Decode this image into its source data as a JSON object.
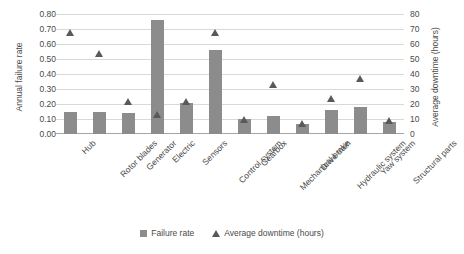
{
  "chart_data": {
    "type": "bar",
    "title": "",
    "xlabel": "",
    "ylabel": "Annual failure rate",
    "y2label": "Average downtime (hours)",
    "ylim": [
      0.0,
      0.8
    ],
    "y2lim": [
      0,
      80
    ],
    "grid": true,
    "legend_position": "bottom",
    "categories": [
      "Hub",
      "Rotor blades",
      "Generator",
      "Electric",
      "Sensors",
      "Control system",
      "Gearbox",
      "Mechanical brake",
      "Drive train",
      "Hydraulic system",
      "Yaw system",
      "Structural parts"
    ],
    "y_ticks": [
      "0.00",
      "0.10",
      "0.20",
      "0.30",
      "0.40",
      "0.50",
      "0.60",
      "0.70",
      "0.80"
    ],
    "y2_ticks": [
      "0",
      "10",
      "20",
      "30",
      "40",
      "50",
      "60",
      "70",
      "80"
    ],
    "series": [
      {
        "name": "Failure rate",
        "type": "bar",
        "axis": "left",
        "color": "#8c8c8c",
        "values": [
          0.15,
          0.15,
          0.14,
          0.76,
          0.21,
          0.56,
          0.1,
          0.12,
          0.07,
          0.16,
          0.18,
          0.08
        ]
      },
      {
        "name": "Average downtime (hours)",
        "type": "scatter",
        "axis": "right",
        "color": "#595959",
        "values": [
          68,
          54,
          22,
          13,
          22,
          68,
          10,
          33,
          7,
          24,
          37,
          9
        ]
      }
    ],
    "legend": [
      {
        "label": "Failure rate",
        "marker": "square",
        "color": "#8c8c8c"
      },
      {
        "label": "Average downtime (hours)",
        "marker": "triangle",
        "color": "#595959"
      }
    ]
  }
}
